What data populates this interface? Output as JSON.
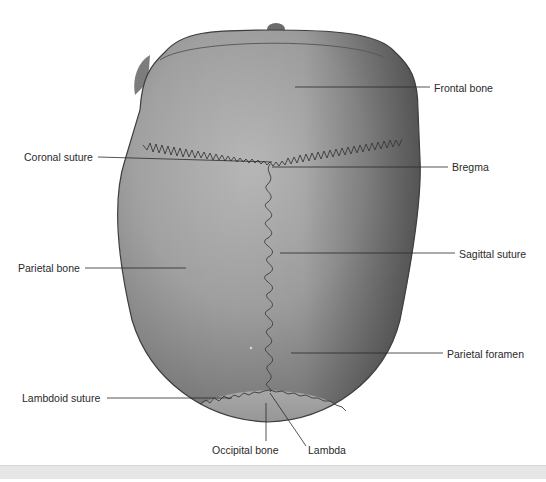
{
  "figure": {
    "labels": [
      {
        "id": "frontal-bone",
        "text": "Frontal bone",
        "x": 434,
        "y": 82,
        "anchor": "start",
        "line": {
          "x1": 295,
          "y1": 87,
          "x2": 430,
          "y2": 87
        }
      },
      {
        "id": "coronal-suture",
        "text": "Coronal suture",
        "x": 24,
        "y": 151,
        "anchor": "start",
        "line": {
          "x1": 98,
          "y1": 157,
          "x2": 272,
          "y2": 162
        }
      },
      {
        "id": "bregma",
        "text": "Bregma",
        "x": 452,
        "y": 161,
        "anchor": "start",
        "line": {
          "x1": 272,
          "y1": 167,
          "x2": 448,
          "y2": 167
        }
      },
      {
        "id": "sagittal-suture",
        "text": "Sagittal suture",
        "x": 459,
        "y": 248,
        "anchor": "start",
        "line": {
          "x1": 280,
          "y1": 253,
          "x2": 455,
          "y2": 253
        }
      },
      {
        "id": "parietal-bone",
        "text": "Parietal bone",
        "x": 18,
        "y": 262,
        "anchor": "start",
        "line": {
          "x1": 85,
          "y1": 268,
          "x2": 186,
          "y2": 268
        }
      },
      {
        "id": "parietal-foramen",
        "text": "Parietal foramen",
        "x": 447,
        "y": 348,
        "anchor": "start",
        "line": {
          "x1": 291,
          "y1": 353,
          "x2": 443,
          "y2": 353
        }
      },
      {
        "id": "lambdoid-suture",
        "text": "Lambdoid suture",
        "x": 22,
        "y": 392,
        "anchor": "start",
        "line": {
          "x1": 107,
          "y1": 398,
          "x2": 232,
          "y2": 398
        }
      },
      {
        "id": "occipital-bone",
        "text": "Occipital bone",
        "x": 212,
        "y": 444,
        "anchor": "start",
        "line": {
          "x1": 266,
          "y1": 403,
          "x2": 266,
          "y2": 441
        }
      },
      {
        "id": "lambda",
        "text": "Lambda",
        "x": 308,
        "y": 444,
        "anchor": "start",
        "line": {
          "x1": 270,
          "y1": 393,
          "x2": 306,
          "y2": 446
        }
      }
    ]
  },
  "colors": {
    "background": "#ffffff",
    "skull_light": "#b8b8b8",
    "skull_mid": "#8a8a8a",
    "skull_dark": "#4a4a4a",
    "occipital": "#9c9c9c",
    "suture": "#3a3a3a",
    "leader_line": "#2a2a2a",
    "label_text": "#2a2a2a",
    "caption_strip": "#e6e6e6"
  }
}
